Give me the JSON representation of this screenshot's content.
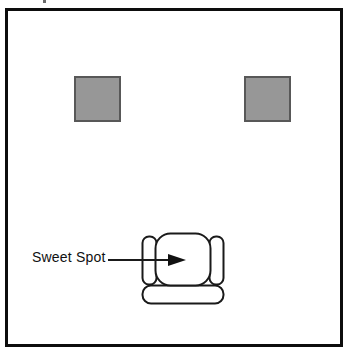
{
  "figure": {
    "type": "room-layout-diagram",
    "background_color": "#ffffff",
    "frame": {
      "name": "room-boundary",
      "color": "#0d0d0d",
      "stroke_width": 3
    },
    "speakers": [
      {
        "label": "left-speaker",
        "fill": "#979797",
        "stroke": "#585858",
        "x": 71,
        "y": 73,
        "width": 47,
        "height": 46
      },
      {
        "label": "right-speaker",
        "fill": "#979797",
        "stroke": "#585858",
        "x": 241,
        "y": 73,
        "width": 47,
        "height": 46
      }
    ],
    "sofa": {
      "label": "listening-sofa",
      "fill": "#ffffff",
      "stroke": "#1a1a1a",
      "parts": [
        "back-cushion",
        "left-armrest",
        "right-armrest",
        "seat-cushion"
      ]
    },
    "callout": {
      "text": "Sweet Spot",
      "arrow_direction": "right",
      "points_to": "sofa-seat-center",
      "color": "#111111"
    }
  }
}
